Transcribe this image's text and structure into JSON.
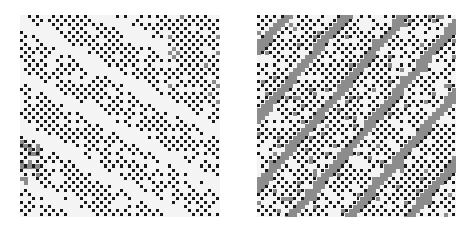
{
  "figure": {
    "background": "#ffffff",
    "panels": [
      {
        "id": "left",
        "grid": {
          "cols": 50,
          "rows": 50
        },
        "colors": {
          "bg": "#f4f4f4",
          "cell": "#1a1a1a",
          "shade": "#8a8a8a"
        },
        "seed": 7,
        "band_direction": "down-right",
        "band_style": "light"
      },
      {
        "id": "right",
        "grid": {
          "cols": 50,
          "rows": 50
        },
        "colors": {
          "bg": "#f4f4f4",
          "cell": "#1a1a1a",
          "shade": "#8c8c8c"
        },
        "seed": 13,
        "band_direction": "up-right",
        "band_style": "gray"
      }
    ]
  }
}
